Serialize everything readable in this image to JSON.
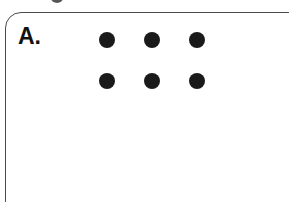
{
  "figure": {
    "panel_label": "A.",
    "caption_fragment_present": true,
    "background_color": "#ffffff",
    "border_color": "#4a4a4a",
    "dot_color": "#1a1a1a",
    "label_color": "#111111"
  },
  "chart_data": {
    "type": "scatter",
    "title": "A.",
    "xlabel": "",
    "ylabel": "",
    "grid": false,
    "legend": "none",
    "rows": 2,
    "columns": 3,
    "dot_count": 6,
    "dot_diameter_px": 16,
    "column_spacing_px": 45,
    "row_spacing_px": 41,
    "xlim": [
      0,
      289
    ],
    "ylim": [
      0,
      202
    ],
    "points": [
      {
        "id": "dot-r1-c1",
        "row": 1,
        "col": 1,
        "x": 107,
        "y": 40
      },
      {
        "id": "dot-r1-c2",
        "row": 1,
        "col": 2,
        "x": 152,
        "y": 40
      },
      {
        "id": "dot-r1-c3",
        "row": 1,
        "col": 3,
        "x": 197,
        "y": 40
      },
      {
        "id": "dot-r2-c1",
        "row": 2,
        "col": 1,
        "x": 107,
        "y": 81
      },
      {
        "id": "dot-r2-c2",
        "row": 2,
        "col": 2,
        "x": 152,
        "y": 81
      },
      {
        "id": "dot-r2-c3",
        "row": 2,
        "col": 3,
        "x": 197,
        "y": 81
      }
    ]
  }
}
